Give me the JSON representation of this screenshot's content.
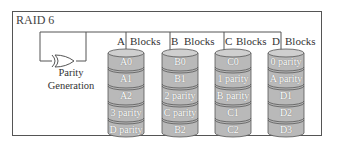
{
  "title": "RAID 6",
  "parity_generation": {
    "line1": "Parity",
    "line2": "Generation"
  },
  "disks": [
    {
      "letter": "A",
      "blocks_label": "Blocks",
      "segments": [
        "A0",
        "A1",
        "A2",
        "3 parity",
        "D parity"
      ]
    },
    {
      "letter": "B",
      "blocks_label": "Blocks",
      "segments": [
        "B0",
        "B1",
        "2 parity",
        "C parity",
        "B2"
      ]
    },
    {
      "letter": "C",
      "blocks_label": "Blocks",
      "segments": [
        "C0",
        "1 parity",
        "B parity",
        "C1",
        "C2"
      ]
    },
    {
      "letter": "D",
      "blocks_label": "Blocks",
      "segments": [
        "0 parity",
        "A parity",
        "D1",
        "D2",
        "D3"
      ]
    }
  ],
  "colors": {
    "disk_fill": "#b9b9b9",
    "disk_top": "#cfcfcf",
    "line": "#555555"
  }
}
